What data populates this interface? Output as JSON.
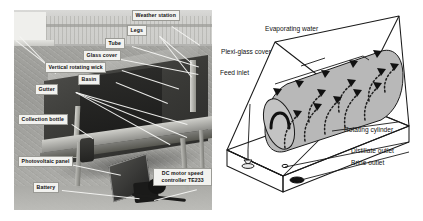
{
  "figure": {
    "left_panel": {
      "type": "photograph",
      "subject": "solar still with vertical rotating wick",
      "labels": [
        {
          "id": "weather-station",
          "text": "Weather station"
        },
        {
          "id": "legs",
          "text": "Legs"
        },
        {
          "id": "tube",
          "text": "Tube"
        },
        {
          "id": "glass-cover",
          "text": "Glass cover"
        },
        {
          "id": "vertical-rotating-wick",
          "text": "Vertical rotating wick"
        },
        {
          "id": "basin",
          "text": "Basin"
        },
        {
          "id": "gutter",
          "text": "Gutter"
        },
        {
          "id": "collection-bottle",
          "text": "Collection bottle"
        },
        {
          "id": "photovoltaic-panel",
          "text": "Photovoltaic panel"
        },
        {
          "id": "battery",
          "text": "Battery"
        },
        {
          "id": "dc-motor-speed-controller",
          "text": "DC motor speed controller TE233"
        }
      ]
    },
    "right_panel": {
      "type": "line-diagram",
      "subject": "rotating cylinder solar still schematic",
      "labels": [
        {
          "id": "evaporating-water",
          "text": "Evaporating water"
        },
        {
          "id": "plexi-glass-cover",
          "text": "Plexi-glass cover"
        },
        {
          "id": "feed-inlet",
          "text": "Feed inlet"
        },
        {
          "id": "rotating-cylinder",
          "text": "Rotating cylinder"
        },
        {
          "id": "distillate-outlet",
          "text": "Distillate outlet"
        },
        {
          "id": "brine-outlet",
          "text": "Brine outlet"
        }
      ]
    },
    "colors": {
      "label_fill": "#f2f2ef",
      "label_border": "#9a9a95",
      "leader_line": "#f4f4f2",
      "diagram_line": "#1a1a1a",
      "cylinder_fill": "#b7b7b7",
      "page_background": "#ffffff"
    }
  }
}
